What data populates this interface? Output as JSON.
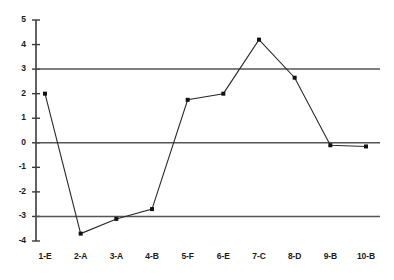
{
  "chart_data": {
    "type": "line",
    "title": "",
    "subtitle": "",
    "xlabel": "",
    "ylabel": "",
    "categories": [
      "1-E",
      "2-A",
      "3-A",
      "4-B",
      "5-F",
      "6-E",
      "7-C",
      "8-D",
      "9-B",
      "10-B"
    ],
    "values": [
      2.0,
      -3.7,
      -3.1,
      -2.7,
      1.75,
      2.0,
      4.2,
      2.65,
      -0.1,
      -0.15
    ],
    "series": [
      {
        "name": "",
        "values": [
          2.0,
          -3.7,
          -3.1,
          -2.7,
          1.75,
          2.0,
          4.2,
          2.65,
          -0.1,
          -0.15
        ]
      }
    ],
    "ylim": [
      -4,
      5
    ],
    "xlim": [
      0,
      11
    ],
    "ytick_labels": [
      "5",
      "4",
      "3",
      "2",
      "1",
      "0",
      "-1",
      "-2",
      "-3",
      "-4"
    ],
    "ytick_values": [
      5,
      4,
      3,
      2,
      1,
      0,
      -1,
      -2,
      -3,
      -4
    ],
    "reference_lines": [
      {
        "name": "upper-control-limit",
        "value": 3
      },
      {
        "name": "center-line",
        "value": 0
      },
      {
        "name": "lower-control-limit",
        "value": -3
      }
    ],
    "grid": false,
    "legend": null,
    "marker": "square",
    "line_color": "#2a2a2a",
    "marker_color": "#111111",
    "reference_line_color": "#555555",
    "axis_color": "#3a3a3a"
  }
}
